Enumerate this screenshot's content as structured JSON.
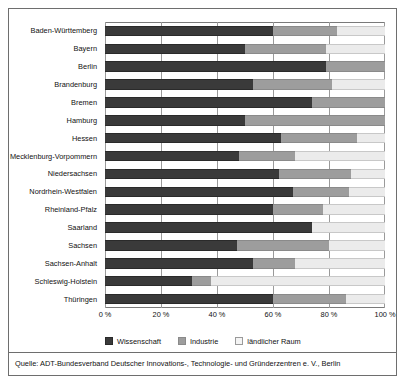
{
  "chart_data": {
    "type": "bar",
    "orientation": "horizontal",
    "stacked": true,
    "normalized_percent": true,
    "title": "",
    "subtitle": "",
    "xlabel": "",
    "ylabel": "",
    "xlim": [
      0,
      100
    ],
    "xticks": [
      "0 %",
      "20 %",
      "40 %",
      "60 %",
      "80 %",
      "100 %"
    ],
    "xtick_values": [
      0,
      20,
      40,
      60,
      80,
      100
    ],
    "grid": "vertical",
    "legend_position": "bottom",
    "categories": [
      "Baden-Württemberg",
      "Bayern",
      "Berlin",
      "Brandenburg",
      "Bremen",
      "Hamburg",
      "Hessen",
      "Mecklenburg-Vorpommern",
      "Niedersachsen",
      "Nordrhein-Westfalen",
      "Rheinland-Pfalz",
      "Saarland",
      "Sachsen",
      "Sachsen-Anhalt",
      "Schleswig-Holstein",
      "Thüringen"
    ],
    "series": [
      {
        "name": "Wissenschaft",
        "color": "#3a3a3a",
        "values": [
          60,
          50,
          79,
          53,
          74,
          50,
          63,
          48,
          62,
          67,
          60,
          74,
          47,
          53,
          31,
          60
        ]
      },
      {
        "name": "Industrie",
        "color": "#9d9d9d",
        "values": [
          23,
          29,
          21,
          28,
          26,
          50,
          27,
          20,
          26,
          20,
          18,
          0,
          33,
          15,
          7,
          26
        ]
      },
      {
        "name": "ländlicher Raum",
        "color": "#ebebeb",
        "values": [
          17,
          21,
          0,
          19,
          0,
          0,
          10,
          32,
          12,
          13,
          22,
          26,
          20,
          32,
          62,
          14
        ]
      }
    ]
  },
  "legend": {
    "items": [
      {
        "label": "Wissenschaft",
        "swatch": "sw-wissenschaft"
      },
      {
        "label": "Industrie",
        "swatch": "sw-industrie"
      },
      {
        "label": "ländlicher Raum",
        "swatch": "sw-laendlich"
      }
    ]
  },
  "source": {
    "text": "Quelle: ADT-Bundesverband Deutscher Innovations-, Technologie- und Gründerzentren e. V., Berlin"
  }
}
